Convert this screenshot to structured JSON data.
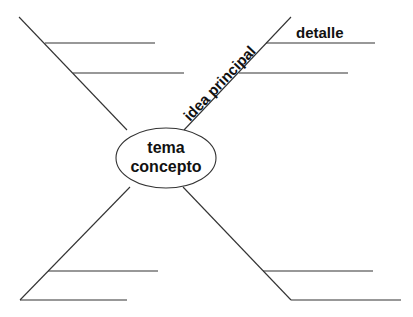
{
  "diagram": {
    "type": "spider-map",
    "center": {
      "line1": "tema",
      "line2": "concepto"
    },
    "branch_label": "idea principal",
    "detail_label": "detalle",
    "colors": {
      "line": "#333333",
      "text": "#111111",
      "background": "#ffffff"
    },
    "branches": [
      {
        "position": "top-left",
        "detail_lines": 2
      },
      {
        "position": "top-right",
        "label": "idea principal",
        "detail_lines": 2,
        "first_detail_label": "detalle"
      },
      {
        "position": "bottom-left",
        "detail_lines": 2
      },
      {
        "position": "bottom-right",
        "detail_lines": 2
      }
    ]
  }
}
